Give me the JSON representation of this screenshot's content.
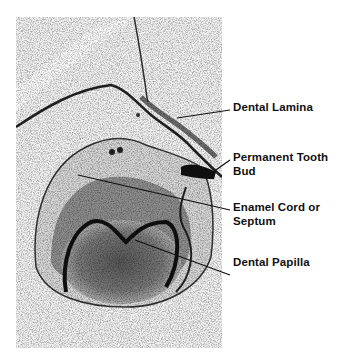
{
  "figure": {
    "type": "histology-micrograph",
    "labels": [
      {
        "id": "dental-lamina",
        "text": "Dental Lamina"
      },
      {
        "id": "permanent-tooth-bud",
        "text": "Permanent Tooth Bud"
      },
      {
        "id": "enamel-cord",
        "text": "Enamel Cord or Septum"
      },
      {
        "id": "dental-papilla",
        "text": "Dental Papilla"
      }
    ]
  }
}
